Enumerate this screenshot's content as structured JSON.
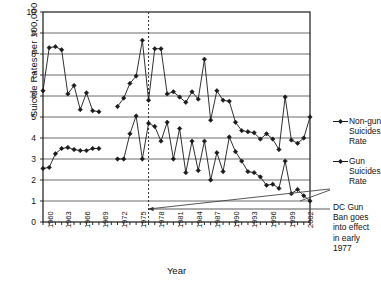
{
  "chart_data": {
    "type": "line",
    "title": "",
    "xlabel": "Year",
    "ylabel": "Suicide Rates per 100,000 People",
    "ylim": [
      0,
      10
    ],
    "xlim": [
      1960,
      2003
    ],
    "ytick_labels": [
      "0",
      "1",
      "2",
      "3",
      "4",
      "5",
      "6",
      "7",
      "8",
      "9",
      "10"
    ],
    "ytick_values": [
      0,
      1,
      2,
      3,
      4,
      5,
      6,
      7,
      8,
      9,
      10
    ],
    "xtick_labels": [
      "1960",
      "1963",
      "1966",
      "1969",
      "1972",
      "1975",
      "1978",
      "1981",
      "1984",
      "1987",
      "1990",
      "1993",
      "1996",
      "1999",
      "2002"
    ],
    "xtick_values": [
      1960,
      1963,
      1966,
      1969,
      1972,
      1975,
      1978,
      1981,
      1984,
      1987,
      1990,
      1993,
      1996,
      1999,
      2002
    ],
    "grid": "horizontal",
    "legend_position": "right",
    "series": [
      {
        "name": "Non-gun Suicides Rate",
        "marker": "diamond",
        "x": [
          1960,
          1961,
          1962,
          1963,
          1964,
          1965,
          1966,
          1967,
          1968,
          1969,
          1972,
          1973,
          1974,
          1975,
          1976,
          1977,
          1978,
          1979,
          1980,
          1981,
          1982,
          1983,
          1984,
          1985,
          1986,
          1987,
          1988,
          1989,
          1990,
          1991,
          1992,
          1993,
          1994,
          1995,
          1996,
          1997,
          1998,
          1999,
          2000,
          2001,
          2002,
          2003
        ],
        "values": [
          6.25,
          8.3,
          8.35,
          8.2,
          6.1,
          6.5,
          5.35,
          6.15,
          5.3,
          5.25,
          5.5,
          5.9,
          6.6,
          6.95,
          8.65,
          5.8,
          8.25,
          8.25,
          6.1,
          6.2,
          5.95,
          5.7,
          6.2,
          5.85,
          7.75,
          4.85,
          6.25,
          5.8,
          5.75,
          4.75,
          4.35,
          4.3,
          4.25,
          3.95,
          4.2,
          3.95,
          3.45,
          5.95,
          3.9,
          3.75,
          4.0,
          5.0
        ]
      },
      {
        "name": "Gun Suicides Rate",
        "marker": "diamond",
        "x": [
          1960,
          1961,
          1962,
          1963,
          1964,
          1965,
          1966,
          1967,
          1968,
          1969,
          1972,
          1973,
          1974,
          1975,
          1976,
          1977,
          1978,
          1979,
          1980,
          1981,
          1982,
          1983,
          1984,
          1985,
          1986,
          1987,
          1988,
          1989,
          1990,
          1991,
          1992,
          1993,
          1994,
          1995,
          1996,
          1997,
          1998,
          1999,
          2000,
          2001,
          2002,
          2003
        ],
        "values": [
          2.55,
          2.6,
          3.25,
          3.5,
          3.55,
          3.45,
          3.4,
          3.4,
          3.5,
          3.5,
          3.0,
          3.0,
          4.2,
          5.05,
          3.0,
          4.7,
          4.55,
          3.85,
          4.75,
          3.0,
          4.45,
          2.35,
          3.85,
          2.45,
          3.85,
          2.0,
          3.3,
          2.4,
          4.05,
          3.35,
          2.9,
          2.4,
          2.35,
          2.15,
          1.75,
          1.8,
          1.6,
          2.9,
          1.35,
          1.55,
          1.25,
          1.0
        ]
      }
    ],
    "annotations": [
      {
        "name": "dc-gun-ban",
        "text": [
          "DC Gun",
          "Ban goes",
          "into effect",
          "in early",
          "1977"
        ],
        "marker_year": 1977,
        "vline_year": 1977,
        "vline_style": "dashed"
      }
    ]
  },
  "legend": {
    "entries": [
      {
        "lines": [
          "Non-gun",
          "Suicides",
          "Rate"
        ]
      },
      {
        "lines": [
          "Gun",
          "Suicides",
          "Rate"
        ]
      }
    ]
  },
  "colors": {
    "line": "#1a1a1a",
    "grid": "#6d6d6d",
    "axis": "#1a1a1a",
    "text": "#111111",
    "background": "#ffffff"
  }
}
